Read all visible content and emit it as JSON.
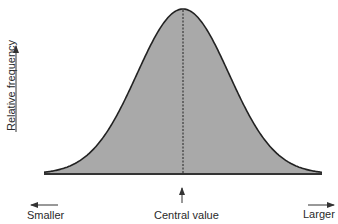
{
  "chart_data": {
    "type": "area",
    "title": "",
    "xlabel": "",
    "ylabel": "Relative frequency",
    "x_annotations": {
      "left": "Smaller",
      "center": "Central value",
      "right": "Larger"
    },
    "x": [
      -3,
      -2.5,
      -2,
      -1.5,
      -1,
      -0.5,
      0,
      0.5,
      1,
      1.5,
      2,
      2.5,
      3
    ],
    "values": [
      0.011,
      0.044,
      0.135,
      0.325,
      0.607,
      0.882,
      1.0,
      0.882,
      0.607,
      0.325,
      0.135,
      0.044,
      0.011
    ],
    "grid": false,
    "legend": null,
    "fill_color": "#a9a9a9",
    "line_color": "#222222"
  },
  "labels": {
    "ylabel": "Relative frequency",
    "left": "Smaller",
    "center": "Central value",
    "right": "Larger"
  }
}
